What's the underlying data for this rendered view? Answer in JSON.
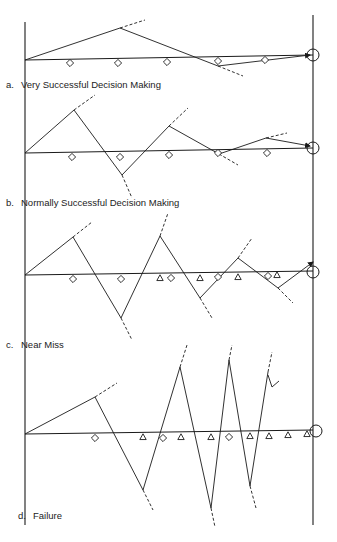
{
  "diagram": {
    "colors": {
      "ink": "#1a1a1a",
      "background": "#ffffff"
    },
    "axes": {
      "left": {
        "x": 25,
        "y1": 22,
        "y2": 525
      },
      "right": {
        "x": 313,
        "y1": 15,
        "y2": 525
      }
    },
    "panels": [
      {
        "id": "a",
        "letter": "a.",
        "label": "Very Successful Decision Making",
        "label_pos": {
          "x": 6,
          "y": 80
        },
        "baseline": {
          "x1": 25,
          "y1": 60,
          "x2": 313,
          "y2": 55
        },
        "target": {
          "x": 313,
          "y": 55,
          "r": 6
        },
        "path": [
          [
            25,
            60
          ],
          [
            120,
            28
          ],
          [
            218,
            66
          ],
          [
            310,
            55
          ]
        ],
        "dashes": [
          [
            [
              120,
              28
            ],
            [
              145,
              20
            ]
          ],
          [
            [
              218,
              66
            ],
            [
              243,
              76
            ]
          ]
        ],
        "diamonds": [
          [
            70,
            63
          ],
          [
            118,
            63
          ],
          [
            167,
            62
          ],
          [
            218,
            61
          ],
          [
            265,
            60
          ]
        ],
        "triangles": [],
        "end_arrow": true
      },
      {
        "id": "b",
        "letter": "b.",
        "label": "Normally Successful Decision Making",
        "label_pos": {
          "x": 6,
          "y": 198
        },
        "baseline": {
          "x1": 25,
          "y1": 153,
          "x2": 313,
          "y2": 148
        },
        "target": {
          "x": 313,
          "y": 148,
          "r": 6
        },
        "path": [
          [
            25,
            153
          ],
          [
            74,
            110
          ],
          [
            122,
            175
          ],
          [
            169,
            126
          ],
          [
            219,
            154
          ],
          [
            266,
            138
          ],
          [
            310,
            146
          ]
        ],
        "dashes": [
          [
            [
              74,
              110
            ],
            [
              95,
              95
            ]
          ],
          [
            [
              122,
              175
            ],
            [
              132,
              198
            ]
          ],
          [
            [
              169,
              126
            ],
            [
              188,
              108
            ]
          ],
          [
            [
              219,
              154
            ],
            [
              238,
              165
            ]
          ],
          [
            [
              266,
              138
            ],
            [
              287,
              133
            ]
          ]
        ],
        "diamonds": [
          [
            72,
            157
          ],
          [
            120,
            157
          ],
          [
            169,
            155
          ],
          [
            218,
            153
          ],
          [
            267,
            153
          ]
        ],
        "triangles": [],
        "end_arrow": true
      },
      {
        "id": "c",
        "letter": "c.",
        "label": "Near Miss",
        "label_pos": {
          "x": 6,
          "y": 340
        },
        "baseline": {
          "x1": 25,
          "y1": 275,
          "x2": 313,
          "y2": 271
        },
        "target": {
          "x": 313,
          "y": 272,
          "r": 6
        },
        "path": [
          [
            25,
            275
          ],
          [
            73,
            237
          ],
          [
            121,
            318
          ],
          [
            160,
            236
          ],
          [
            200,
            298
          ],
          [
            238,
            258
          ],
          [
            278,
            288
          ],
          [
            313,
            262
          ]
        ],
        "dashes": [
          [
            [
              73,
              237
            ],
            [
              92,
              222
            ]
          ],
          [
            [
              121,
              318
            ],
            [
              132,
              340
            ]
          ],
          [
            [
              160,
              236
            ],
            [
              168,
              213
            ]
          ],
          [
            [
              200,
              298
            ],
            [
              212,
              318
            ]
          ],
          [
            [
              238,
              258
            ],
            [
              252,
              238
            ]
          ],
          [
            [
              278,
              288
            ],
            [
              293,
              303
            ]
          ]
        ],
        "diamonds": [
          [
            73,
            279
          ],
          [
            121,
            279
          ],
          [
            171,
            278
          ],
          [
            218,
            277
          ],
          [
            268,
            276
          ]
        ],
        "triangles": [
          [
            160,
            278
          ],
          [
            200,
            278
          ],
          [
            238,
            277
          ],
          [
            277,
            275
          ]
        ],
        "end_arrow": true
      },
      {
        "id": "d",
        "letter": "d.",
        "label": "Failure",
        "label_pos": {
          "x": 18,
          "y": 511
        },
        "baseline": {
          "x1": 25,
          "y1": 434,
          "x2": 313,
          "y2": 430
        },
        "target": {
          "x": 316,
          "y": 431,
          "r": 6
        },
        "path": [
          [
            25,
            434
          ],
          [
            95,
            397
          ],
          [
            143,
            490
          ],
          [
            180,
            367
          ],
          [
            211,
            508
          ],
          [
            229,
            360
          ],
          [
            250,
            486
          ],
          [
            268,
            372
          ]
        ],
        "dashes": [
          [
            [
              95,
              397
            ],
            [
              117,
              383
            ]
          ],
          [
            [
              143,
              490
            ],
            [
              153,
              510
            ]
          ],
          [
            [
              180,
              367
            ],
            [
              187,
              345
            ]
          ],
          [
            [
              211,
              508
            ],
            [
              215,
              527
            ]
          ],
          [
            [
              229,
              360
            ],
            [
              232,
              345
            ]
          ],
          [
            [
              250,
              486
            ],
            [
              256,
              508
            ]
          ],
          [
            [
              268,
              372
            ],
            [
              272,
              352
            ]
          ]
        ],
        "diamonds": [
          [
            95,
            438
          ],
          [
            163,
            438
          ],
          [
            229,
            437
          ]
        ],
        "triangles": [
          [
            143,
            437
          ],
          [
            181,
            437
          ],
          [
            211,
            437
          ],
          [
            250,
            436
          ],
          [
            269,
            436
          ],
          [
            288,
            435
          ],
          [
            307,
            434
          ]
        ],
        "end_arrow": false,
        "annotation_mark": [
          [
            268,
            375
          ],
          [
            272,
            387
          ],
          [
            279,
            381
          ]
        ]
      }
    ]
  }
}
